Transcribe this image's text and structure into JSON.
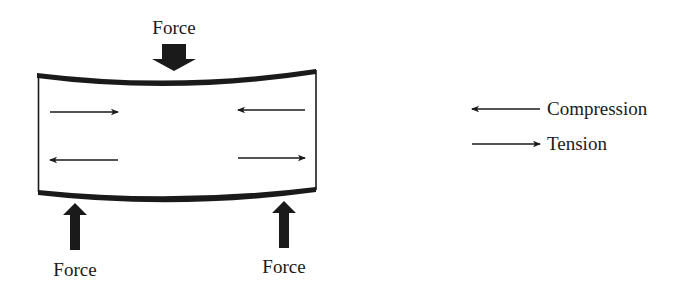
{
  "diagram": {
    "force_label": "Force",
    "forces": [
      {
        "id": "top",
        "label": "Force",
        "direction": "down"
      },
      {
        "id": "bottom-left",
        "label": "Force",
        "direction": "up"
      },
      {
        "id": "bottom-right",
        "label": "Force",
        "direction": "up"
      }
    ],
    "inner_arrows": [
      {
        "row": "top",
        "side": "left",
        "direction": "right"
      },
      {
        "row": "top",
        "side": "right",
        "direction": "left"
      },
      {
        "row": "bottom",
        "side": "left",
        "direction": "left"
      },
      {
        "row": "bottom",
        "side": "right",
        "direction": "right"
      }
    ],
    "legend": [
      {
        "arrow": "left-arrow",
        "label": "Compression"
      },
      {
        "arrow": "right-arrow",
        "label": "Tension"
      }
    ],
    "colors": {
      "ink": "#1a1a1a",
      "background": "#ffffff"
    }
  }
}
